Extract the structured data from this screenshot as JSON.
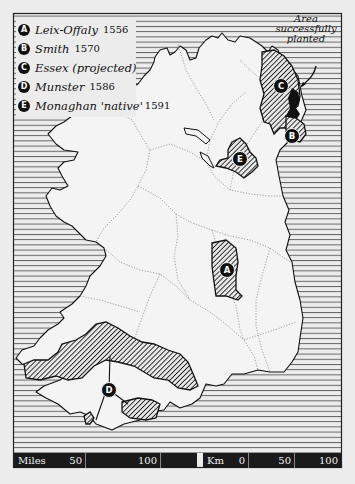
{
  "legend": {
    "items": [
      {
        "key": "A",
        "name": "Leix-Offaly",
        "year": "1556"
      },
      {
        "key": "B",
        "name": "Smith",
        "year": "1570"
      },
      {
        "key": "C",
        "name": "Essex (projected)",
        "year": ""
      },
      {
        "key": "D",
        "name": "Munster",
        "year": "1586"
      },
      {
        "key": "E",
        "name": "Monaghan 'native'",
        "year": "1591"
      }
    ]
  },
  "annotation": {
    "line1": "Area",
    "line2": "successfully",
    "line3": "planted"
  },
  "map_labels": {
    "A": "A",
    "B": "B",
    "C": "C",
    "D": "D",
    "E": "E"
  },
  "scale": {
    "miles_label": "Miles",
    "miles_ticks": [
      "50",
      "100"
    ],
    "km_label": "Km",
    "km_ticks": [
      "0",
      "50",
      "100"
    ]
  },
  "colors": {
    "background": "#ececec",
    "land": "#f4f4f4",
    "ink": "#111111",
    "sea_lines": "#555555"
  }
}
